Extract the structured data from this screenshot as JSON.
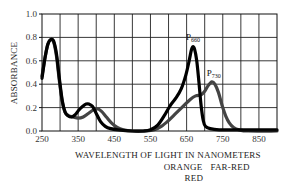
{
  "chart_data": {
    "type": "line",
    "title": "",
    "xlabel": "WAVELENGTH OF LIGHT IN NANOMETERS",
    "ylabel": "ABSORBANCE",
    "xlim": [
      250,
      900
    ],
    "ylim": [
      0.0,
      1.0
    ],
    "x_ticks": [
      250,
      350,
      450,
      550,
      650,
      750,
      850
    ],
    "x_tick_labels": [
      "250",
      "350",
      "450",
      "550",
      "650",
      "750",
      "850"
    ],
    "y_ticks": [
      0.0,
      0.2,
      0.4,
      0.6,
      0.8,
      1.0
    ],
    "y_tick_labels": [
      "0.0",
      "0.2",
      "0.4",
      "0.6",
      "0.8",
      "1.0"
    ],
    "grid": true,
    "x_grid_step": 50,
    "region_labels": [
      {
        "text": "ORANGE",
        "x": 640
      },
      {
        "text": "FAR-RED",
        "x": 770
      },
      {
        "text": "RED",
        "x": 670
      }
    ],
    "series": [
      {
        "name": "P660",
        "label_main": "P",
        "label_sub": "660",
        "color": "#000000",
        "label_at": {
          "x": 665,
          "y": 0.74
        },
        "points": [
          [
            250,
            0.45
          ],
          [
            258,
            0.62
          ],
          [
            266,
            0.74
          ],
          [
            274,
            0.78
          ],
          [
            282,
            0.77
          ],
          [
            290,
            0.66
          ],
          [
            298,
            0.45
          ],
          [
            306,
            0.26
          ],
          [
            314,
            0.16
          ],
          [
            322,
            0.13
          ],
          [
            332,
            0.12
          ],
          [
            342,
            0.14
          ],
          [
            352,
            0.18
          ],
          [
            362,
            0.21
          ],
          [
            372,
            0.23
          ],
          [
            380,
            0.23
          ],
          [
            390,
            0.21
          ],
          [
            400,
            0.15
          ],
          [
            412,
            0.08
          ],
          [
            425,
            0.04
          ],
          [
            440,
            0.02
          ],
          [
            460,
            0.01
          ],
          [
            500,
            0.0
          ],
          [
            530,
            0.0
          ],
          [
            550,
            0.01
          ],
          [
            570,
            0.05
          ],
          [
            590,
            0.14
          ],
          [
            605,
            0.22
          ],
          [
            620,
            0.28
          ],
          [
            635,
            0.36
          ],
          [
            648,
            0.48
          ],
          [
            657,
            0.6
          ],
          [
            663,
            0.69
          ],
          [
            667,
            0.72
          ],
          [
            672,
            0.7
          ],
          [
            678,
            0.6
          ],
          [
            684,
            0.42
          ],
          [
            690,
            0.22
          ],
          [
            696,
            0.09
          ],
          [
            702,
            0.04
          ],
          [
            715,
            0.02
          ],
          [
            740,
            0.01
          ],
          [
            800,
            0.01
          ],
          [
            900,
            0.01
          ]
        ]
      },
      {
        "name": "P730",
        "label_main": "P",
        "label_sub": "730",
        "color": "#444444",
        "label_at": {
          "x": 722,
          "y": 0.44
        },
        "points": [
          [
            250,
            0.47
          ],
          [
            258,
            0.62
          ],
          [
            266,
            0.74
          ],
          [
            274,
            0.78
          ],
          [
            282,
            0.76
          ],
          [
            290,
            0.64
          ],
          [
            298,
            0.43
          ],
          [
            306,
            0.25
          ],
          [
            314,
            0.16
          ],
          [
            324,
            0.13
          ],
          [
            336,
            0.12
          ],
          [
            350,
            0.11
          ],
          [
            364,
            0.12
          ],
          [
            378,
            0.15
          ],
          [
            392,
            0.18
          ],
          [
            402,
            0.19
          ],
          [
            414,
            0.17
          ],
          [
            428,
            0.12
          ],
          [
            442,
            0.07
          ],
          [
            458,
            0.03
          ],
          [
            475,
            0.01
          ],
          [
            500,
            0.0
          ],
          [
            540,
            0.0
          ],
          [
            560,
            0.01
          ],
          [
            580,
            0.04
          ],
          [
            600,
            0.09
          ],
          [
            620,
            0.15
          ],
          [
            640,
            0.21
          ],
          [
            660,
            0.27
          ],
          [
            675,
            0.3
          ],
          [
            690,
            0.31
          ],
          [
            700,
            0.34
          ],
          [
            710,
            0.39
          ],
          [
            720,
            0.42
          ],
          [
            728,
            0.4
          ],
          [
            738,
            0.33
          ],
          [
            748,
            0.22
          ],
          [
            758,
            0.13
          ],
          [
            768,
            0.07
          ],
          [
            780,
            0.03
          ],
          [
            795,
            0.01
          ],
          [
            820,
            0.0
          ],
          [
            900,
            0.0
          ]
        ]
      }
    ]
  }
}
